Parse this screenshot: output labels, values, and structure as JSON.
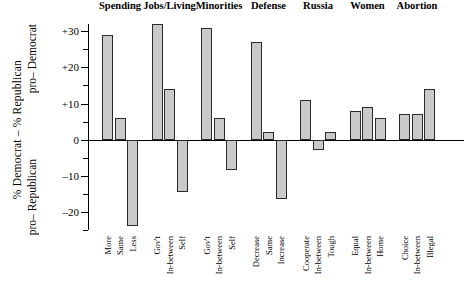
{
  "chart_data": {
    "type": "bar",
    "title": "",
    "xlabel": "",
    "ylabel": "% Democrat – % Republican",
    "ylabel_upper": "pro–\nDemocrat",
    "ylabel_lower": "pro–\nRepublican",
    "ylim": [
      -25,
      32
    ],
    "yticks": [
      -20,
      -10,
      0,
      10,
      20,
      30
    ],
    "ytick_labels": [
      "–20",
      "–10",
      "0",
      "+10",
      "+20",
      "+30"
    ],
    "minor_tick_step": 5,
    "grid": false,
    "legend": "none",
    "groups": [
      {
        "name": "Spending",
        "categories": [
          "More",
          "Same",
          "Less"
        ],
        "values": [
          29,
          6,
          -24
        ]
      },
      {
        "name": "Jobs/Living",
        "categories": [
          "Gov't",
          "In-between",
          "Self"
        ],
        "values": [
          32,
          14,
          -14.5
        ]
      },
      {
        "name": "Minorities",
        "categories": [
          "Gov't",
          "In-between",
          "Self"
        ],
        "values": [
          31,
          6,
          -8.5
        ]
      },
      {
        "name": "Defense",
        "categories": [
          "Decrease",
          "Same",
          "Increase"
        ],
        "values": [
          27,
          2,
          -16.5
        ]
      },
      {
        "name": "Russia",
        "categories": [
          "Cooperate",
          "In-between",
          "Tough"
        ],
        "values": [
          11,
          -3,
          2
        ]
      },
      {
        "name": "Women",
        "categories": [
          "Equal",
          "In-between",
          "Home"
        ],
        "values": [
          8,
          9,
          6
        ]
      },
      {
        "name": "Abortion",
        "categories": [
          "Choice",
          "In-between",
          "Illegal"
        ],
        "values": [
          7,
          7,
          14
        ]
      }
    ]
  },
  "style": {
    "bar_fill": "#c9c9c9",
    "bar_stroke": "#2b2b2b",
    "axis_color": "#000000",
    "background": "#ffffff"
  }
}
